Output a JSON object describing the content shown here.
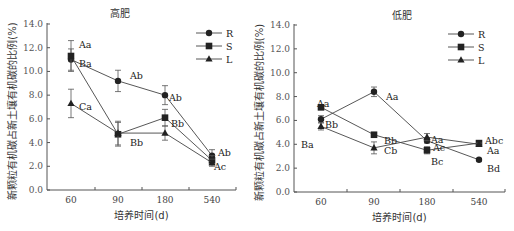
{
  "chart_data": [
    {
      "type": "line",
      "title": "高肥",
      "xlabel": "培养时间(d)",
      "ylabel": "新颗粒有机碳占新土壤有机碳的比例(%)",
      "categories": [
        "60",
        "90",
        "180",
        "540"
      ],
      "ylim": [
        0,
        14
      ],
      "yticks": [
        "0.0",
        "2.0",
        "4.0",
        "6.0",
        "8.0",
        "10.0",
        "12.0",
        "14.0"
      ],
      "grid": false,
      "legend_position": "top-right",
      "series": [
        {
          "name": "R",
          "marker": "circle",
          "values": [
            11.0,
            9.2,
            8.0,
            2.9
          ],
          "errors": [
            0.9,
            0.9,
            0.8,
            0.5
          ]
        },
        {
          "name": "S",
          "marker": "square",
          "values": [
            11.3,
            4.7,
            6.1,
            2.5
          ],
          "errors": [
            1.3,
            1.0,
            0.7,
            0.4
          ]
        },
        {
          "name": "L",
          "marker": "triangle",
          "values": [
            7.3,
            4.8,
            4.8,
            2.3
          ],
          "errors": [
            1.2,
            1.0,
            0.6,
            0.3
          ]
        }
      ],
      "annotations": [
        {
          "text": "Aa",
          "cat": 0,
          "y": 12.2,
          "dx": 8
        },
        {
          "text": "Ba",
          "cat": 0,
          "y": 10.6,
          "dx": 8
        },
        {
          "text": "Ca",
          "cat": 0,
          "y": 7.0,
          "dx": 8
        },
        {
          "text": "Ab",
          "cat": 1,
          "y": 9.6,
          "dx": 12
        },
        {
          "text": "Bb",
          "cat": 1,
          "y": 4.0,
          "dx": 12
        },
        {
          "text": "Ab",
          "cat": 2,
          "y": 7.8,
          "dx": 4
        },
        {
          "text": "Bb",
          "cat": 2,
          "y": 5.6,
          "dx": 6
        },
        {
          "text": "Ab",
          "cat": 3,
          "y": 3.1,
          "dx": 6
        },
        {
          "text": "Ac",
          "cat": 3,
          "y": 1.9,
          "dx": 2
        }
      ]
    },
    {
      "type": "line",
      "title": "低肥",
      "xlabel": "培养时间(d)",
      "ylabel": "新颗粒有机碳占新土壤有机碳的比例(%)",
      "categories": [
        "60",
        "90",
        "180",
        "540"
      ],
      "ylim": [
        0,
        14
      ],
      "yticks": [
        "0.0",
        "2.0",
        "4.0",
        "6.0",
        "8.0",
        "10.0",
        "12.0",
        "14.0"
      ],
      "grid": false,
      "legend_position": "top-right",
      "series": [
        {
          "name": "R",
          "marker": "circle",
          "values": [
            6.1,
            8.4,
            4.3,
            2.7
          ],
          "errors": [
            0.3,
            0.4,
            0.2,
            0.1
          ]
        },
        {
          "name": "S",
          "marker": "square",
          "values": [
            7.1,
            4.8,
            3.5,
            4.1
          ],
          "errors": [
            0.2,
            0.1,
            0.3,
            0.2
          ]
        },
        {
          "name": "L",
          "marker": "triangle",
          "values": [
            5.5,
            3.7,
            4.6,
            4.0
          ],
          "errors": [
            0.3,
            0.5,
            0.3,
            0.1
          ]
        }
      ],
      "annotations": [
        {
          "text": "Aa",
          "cat": 0,
          "y": 7.4,
          "dx": -4
        },
        {
          "text": "Bb",
          "cat": 0,
          "y": 5.6,
          "dx": 4
        },
        {
          "text": "Ba",
          "cat": 0,
          "y": 3.9,
          "dx": -20
        },
        {
          "text": "Aa",
          "cat": 1,
          "y": 8.0,
          "dx": 12
        },
        {
          "text": "Bb",
          "cat": 1,
          "y": 4.3,
          "dx": 10
        },
        {
          "text": "Cb",
          "cat": 1,
          "y": 3.4,
          "dx": 10
        },
        {
          "text": "Aa",
          "cat": 2,
          "y": 4.4,
          "dx": 4
        },
        {
          "text": "Ac",
          "cat": 2,
          "y": 3.7,
          "dx": 6
        },
        {
          "text": "Bc",
          "cat": 2,
          "y": 2.5,
          "dx": 4
        },
        {
          "text": "Abc",
          "cat": 3,
          "y": 4.3,
          "dx": 6
        },
        {
          "text": "Aa",
          "cat": 3,
          "y": 3.4,
          "dx": 8
        },
        {
          "text": "Bd",
          "cat": 3,
          "y": 1.9,
          "dx": 8
        }
      ]
    }
  ]
}
